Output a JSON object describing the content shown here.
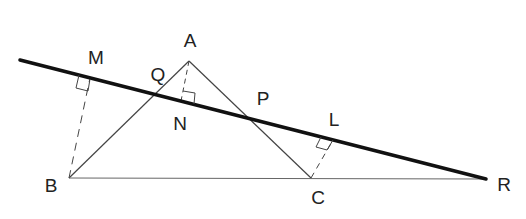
{
  "diagram": {
    "type": "geometry",
    "colors": {
      "stroke": "#222222",
      "thin": "#555555",
      "background": "#ffffff"
    },
    "points": {
      "A": {
        "label": "A",
        "x": 189,
        "y": 61,
        "lx": 190,
        "ly": 47
      },
      "B": {
        "label": "B",
        "x": 69,
        "y": 178,
        "lx": 51,
        "ly": 192
      },
      "C": {
        "label": "C",
        "x": 311,
        "y": 178,
        "lx": 318,
        "ly": 204
      },
      "R": {
        "label": "R",
        "x": 486,
        "y": 179,
        "lx": 504,
        "ly": 191
      },
      "M": {
        "label": "M",
        "x": 90,
        "y": 78,
        "lx": 96,
        "ly": 64
      },
      "N": {
        "label": "N",
        "x": 181,
        "y": 101,
        "lx": 180,
        "ly": 130
      },
      "L": {
        "label": "L",
        "x": 333,
        "y": 140,
        "lx": 334,
        "ly": 126
      },
      "Q": {
        "label": "Q",
        "x": 154,
        "y": 93,
        "lx": 160,
        "ly": 81
      },
      "P": {
        "label": "P",
        "x": 250,
        "y": 117,
        "lx": 262,
        "ly": 105
      }
    },
    "segments": [
      {
        "from": "A",
        "to": "B",
        "style": "thin"
      },
      {
        "from": "A",
        "to": "C",
        "style": "thin"
      },
      {
        "from": "B",
        "to": "R",
        "style": "thin"
      },
      {
        "from": "B",
        "to": "M",
        "style": "dashed"
      },
      {
        "from": "A",
        "to": "N",
        "style": "dashed"
      },
      {
        "from": "C",
        "to": "L",
        "style": "dashed"
      }
    ],
    "transversal": {
      "from": [
        20,
        60
      ],
      "to": "R",
      "style": "thick"
    },
    "right_angles": [
      "M",
      "N",
      "L"
    ]
  }
}
